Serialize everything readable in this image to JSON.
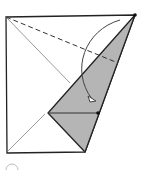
{
  "diagram": {
    "type": "origami-fold-step",
    "canvas": {
      "width": 150,
      "height": 171,
      "background": "#ffffff"
    },
    "colors": {
      "outline": "#222222",
      "crease": "#9a9a9a",
      "valley_fold": "#333333",
      "flap_fill": "#b5b5b5",
      "arrow": "#444444",
      "dot": "#111111"
    },
    "paper_outline": {
      "points": "6,17 135,15 85,152 7,153"
    },
    "crease_diagonal": {
      "x1": 6,
      "y1": 17,
      "x2": 70,
      "y2": 83
    },
    "crease_lower": {
      "x1": 8,
      "y1": 151,
      "x2": 45,
      "y2": 114
    },
    "valley_fold_line": {
      "x1": 6,
      "y1": 17,
      "x2": 118,
      "y2": 63,
      "dash": "5,3"
    },
    "folded_flap": {
      "points": "135,15 48,113 85,152"
    },
    "flap_inner_line": {
      "x1": 48,
      "y1": 113,
      "x2": 98,
      "y2": 113
    },
    "reference_points": [
      {
        "name": "top-right-corner",
        "cx": 135,
        "cy": 15
      },
      {
        "name": "edge-point",
        "cx": 98,
        "cy": 113
      }
    ],
    "fold_arrow": {
      "path": "M 120 20 C 85 30, 70 70, 92 99",
      "head": "88,96 96,101 90,102"
    },
    "partial_next_step_marker": {
      "path": "M 6 170 A 6 6 0 0 1 18 170"
    }
  }
}
